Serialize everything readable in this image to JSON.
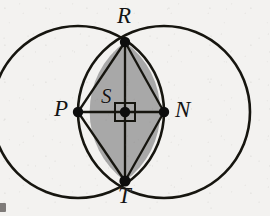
{
  "figure": {
    "background_color": "#f3f2f0",
    "stroke_color": "#16150f",
    "lens_fill_color": "#a8a8a8",
    "point_color": "#0d0d0d"
  },
  "labels": {
    "R": "R",
    "T": "T",
    "P": "P",
    "N": "N",
    "S": "S"
  },
  "geometry": {
    "left_circle": {
      "cx": 78,
      "cy": 112,
      "r": 86
    },
    "right_circle": {
      "cx": 164,
      "cy": 112,
      "r": 86
    },
    "points": {
      "R": {
        "x": 125,
        "y": 42
      },
      "T": {
        "x": 125,
        "y": 181
      },
      "P": {
        "x": 78,
        "y": 112
      },
      "N": {
        "x": 164,
        "y": 112
      },
      "S": {
        "x": 125,
        "y": 112
      }
    },
    "right_angle_marker": {
      "x": 125,
      "y": 112,
      "width": 20,
      "height": 18
    },
    "segments": [
      {
        "from": "P",
        "to": "N"
      },
      {
        "from": "R",
        "to": "T"
      },
      {
        "from": "R",
        "to": "P"
      },
      {
        "from": "R",
        "to": "N"
      },
      {
        "from": "T",
        "to": "P"
      },
      {
        "from": "T",
        "to": "N"
      }
    ],
    "shaded_region": "lens PRNT bounded by the two circular arcs"
  }
}
